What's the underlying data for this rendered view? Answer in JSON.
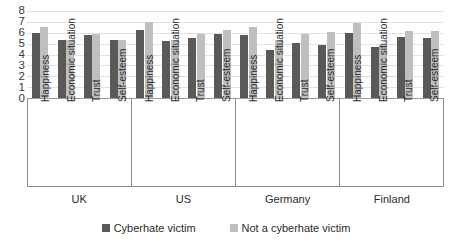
{
  "chart_data": {
    "type": "bar",
    "title": "",
    "subtitle": "",
    "xlabel": "",
    "ylabel": "",
    "ylim": [
      0,
      8
    ],
    "yticks": [
      0,
      1,
      2,
      3,
      4,
      5,
      6,
      7,
      8
    ],
    "grid": true,
    "legend_position": "bottom-center",
    "grouping": "grouped",
    "groups": [
      "UK",
      "US",
      "Germany",
      "Finland"
    ],
    "categories": [
      "Happiness",
      "Economic situation",
      "Trust",
      "Self-esteem"
    ],
    "series": [
      {
        "name": "Cyberhate victim",
        "color": "#595959",
        "values": [
          [
            6.0,
            5.35,
            5.75,
            5.3
          ],
          [
            6.3,
            5.2,
            5.5,
            5.85
          ],
          [
            5.8,
            4.45,
            5.05,
            4.85
          ],
          [
            6.0,
            4.7,
            5.65,
            5.55
          ]
        ]
      },
      {
        "name": "Not a cyberhate victim",
        "color": "#bfbfbf",
        "values": [
          [
            6.5,
            5.3,
            5.85,
            5.3
          ],
          [
            7.0,
            5.35,
            5.9,
            6.3
          ],
          [
            6.5,
            5.35,
            5.9,
            6.1
          ],
          [
            6.9,
            5.0,
            6.2,
            6.2
          ]
        ]
      }
    ]
  },
  "axis": {
    "y_tick_labels": [
      "8",
      "7",
      "6",
      "5",
      "4",
      "3",
      "2",
      "1",
      "0"
    ]
  },
  "legend": {
    "items": [
      {
        "label": "Cyberhate victim",
        "color": "#595959"
      },
      {
        "label": "Not a cyberhate victim",
        "color": "#bfbfbf"
      }
    ]
  }
}
